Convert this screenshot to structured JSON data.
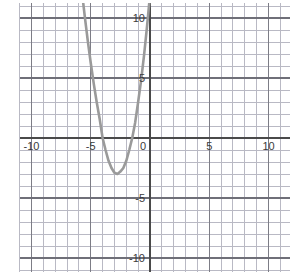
{
  "chart_data": {
    "type": "line",
    "title": "",
    "xlabel": "",
    "ylabel": "",
    "xlim": [
      -11,
      11.8
    ],
    "ylim": [
      -11.2,
      11.2
    ],
    "grid": true,
    "legend": false,
    "axis_color": "#4a4a4a",
    "grid_color": "#b9b9c4",
    "curve_color": "#9a9a9a",
    "x_ticks": [
      -10,
      -5,
      0,
      5,
      10
    ],
    "y_ticks": [
      10,
      5,
      -5,
      -10
    ],
    "x_tick_labels": [
      "-10",
      "-5",
      "0",
      "5",
      "10"
    ],
    "y_tick_labels": [
      "10",
      "5",
      "-5",
      "-10"
    ],
    "x_major_step": 5,
    "y_major_step": 5,
    "x_minor_step": 1,
    "y_minor_step": 1,
    "series": [
      {
        "name": "parabola",
        "equation": "y = 1.25(x + 4)(x + 1)",
        "vertex": [
          -2.5,
          -2.8
        ],
        "roots": [
          -4,
          -1
        ],
        "y_intercept": 5,
        "x": [
          -5.7,
          -5.5,
          -5.25,
          -5.0,
          -4.75,
          -4.5,
          -4.25,
          -4.0,
          -3.75,
          -3.5,
          -3.25,
          -3.0,
          -2.75,
          -2.5,
          -2.25,
          -2.0,
          -1.75,
          -1.5,
          -1.25,
          -1.0,
          -0.75,
          -0.5,
          -0.25,
          0.0,
          0.25,
          0.5,
          0.65
        ],
        "y": [
          11.8,
          10.1,
          8.1,
          6.25,
          4.55,
          3.0,
          1.6,
          0.0,
          -1.0,
          -1.9,
          -2.5,
          -2.9,
          -3.0,
          -2.8,
          -2.5,
          -1.9,
          -1.0,
          0.0,
          1.3,
          3.0,
          4.8,
          6.9,
          9.3,
          11.9,
          14.8,
          17.8,
          20.0
        ],
        "style": "solid",
        "width": 2.6
      }
    ]
  },
  "geometry": {
    "origin_x": 150,
    "origin_y": 138,
    "unit_x": 11.85,
    "unit_y": 12.0,
    "plot_left": 20,
    "plot_right": 290,
    "plot_top": 3,
    "plot_bottom": 272
  }
}
